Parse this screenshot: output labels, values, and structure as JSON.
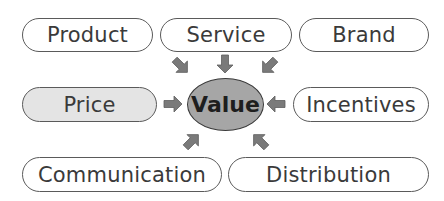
{
  "diagram": {
    "center": {
      "label": "Value",
      "fill": "#a6a6a6"
    },
    "nodes": [
      {
        "id": "product",
        "label": "Product",
        "highlighted": false
      },
      {
        "id": "service",
        "label": "Service",
        "highlighted": false
      },
      {
        "id": "brand",
        "label": "Brand",
        "highlighted": false
      },
      {
        "id": "price",
        "label": "Price",
        "highlighted": true
      },
      {
        "id": "incentives",
        "label": "Incentives",
        "highlighted": false
      },
      {
        "id": "communication",
        "label": "Communication",
        "highlighted": false
      },
      {
        "id": "distribution",
        "label": "Distribution",
        "highlighted": false
      }
    ],
    "colors": {
      "arrow": "#7a7a7a",
      "pill_border": "#5a5a5a",
      "highlight_fill": "#e4e4e4"
    }
  }
}
